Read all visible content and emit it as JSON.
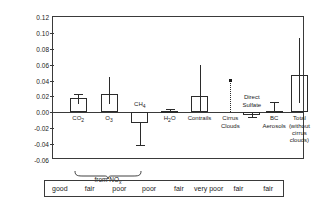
{
  "chart_data": {
    "type": "bar",
    "title": "",
    "xlabel": "",
    "ylabel": "Radiative Forcing (Wm-2)",
    "ylabel_parts": {
      "main": "Radiative Forcing (Wm",
      "sup": "-2",
      "tail": ")"
    },
    "ylim": [
      -0.06,
      0.12
    ],
    "yticks": [
      -0.06,
      -0.04,
      -0.02,
      0.0,
      0.02,
      0.04,
      0.06,
      0.08,
      0.1,
      0.12
    ],
    "ytick_labels": [
      "-0.06",
      "-0.04",
      "-0.02",
      "0.00",
      "0.02",
      "0.04",
      "0.06",
      "0.08",
      "0.10",
      "0.12"
    ],
    "grid": false,
    "legend": "none",
    "categories": [
      "CO2",
      "O3",
      "CH4",
      "H2O",
      "Contrails",
      "Cirrus Clouds",
      "Direct Sulfate",
      "BC Aerosols",
      "Total (without cirrus clouds)"
    ],
    "values": [
      0.018,
      0.023,
      -0.013,
      0.002,
      0.02,
      0.04,
      -0.003,
      0.002,
      0.047
    ],
    "err_low": [
      0.011,
      0.01,
      -0.041,
      0.0,
      0.0,
      0.0,
      -0.006,
      -0.001,
      0.012
    ],
    "err_high": [
      0.023,
      0.045,
      0.0,
      0.004,
      0.06,
      0.04,
      0.0,
      0.013,
      0.094
    ],
    "series_marks": [
      "bar",
      "bar",
      "bar",
      "bar",
      "bar",
      "dotted-line-marker",
      "bar",
      "bar",
      "bar"
    ],
    "annotations": [
      {
        "name": "nox-brace",
        "text": "from NOx",
        "spans": [
          "O3",
          "CH4"
        ]
      }
    ],
    "quality_row": [
      "good",
      "fair",
      "poor",
      "poor",
      "fair",
      "very poor",
      "fair",
      "fair"
    ]
  },
  "labels": {
    "co2": {
      "main": "CO",
      "sub": "2"
    },
    "o3": {
      "main": "O",
      "sub": "3"
    },
    "ch4": {
      "main": "CH",
      "sub": "4"
    },
    "h2o": {
      "main": "H",
      "sub": "2",
      "tail": "O"
    },
    "contrails": "Contrails",
    "cirrus_line1": "Cirrus",
    "cirrus_line2": "Clouds",
    "sulfate_line1": "Direct",
    "sulfate_line2": "Sulfate",
    "bc_line1": "BC",
    "bc_line2": "Aerosols",
    "total_line1": "Total",
    "total_line2": "(without",
    "total_line3": "cirrus",
    "total_line4": "clouds)",
    "brace_main": "from NO",
    "brace_sub": "x"
  },
  "colors": {
    "axis": "#3a3a3a",
    "bar_outline": "#2b2b2b",
    "text": "#1a1a1a",
    "background": "#ffffff"
  }
}
